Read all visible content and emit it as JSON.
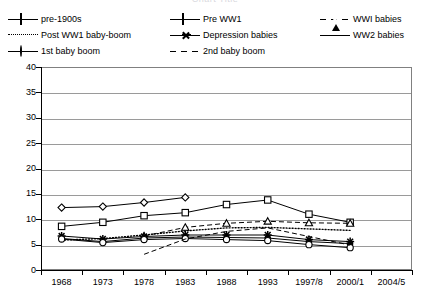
{
  "chart_data": {
    "type": "line",
    "title": "Chart Title",
    "xlabel": "",
    "ylabel": "",
    "ylim": [
      0,
      40
    ],
    "ytick_step": 5,
    "yticks": [
      "0",
      "5",
      "10",
      "15",
      "20",
      "25",
      "30",
      "35",
      "40"
    ],
    "grid": true,
    "legend_position": "top",
    "categories": [
      "1968",
      "1973",
      "1978",
      "1983",
      "1988",
      "1993",
      "1997/8",
      "2000/1",
      "2004/5"
    ],
    "series": [
      {
        "name": "pre-1900s",
        "marker": "open-diamond",
        "line": "solid",
        "values": [
          12.3,
          12.5,
          13.3,
          14.3,
          null,
          null,
          null,
          null,
          null
        ]
      },
      {
        "name": "Pre WW1",
        "marker": "open-square",
        "line": "solid",
        "values": [
          8.6,
          9.4,
          10.7,
          11.3,
          12.9,
          13.8,
          11.0,
          9.4,
          null
        ]
      },
      {
        "name": "WWI babies",
        "marker": "open-triangle",
        "line": "dashed",
        "values": [
          null,
          null,
          6.7,
          8.4,
          9.2,
          9.6,
          9.3,
          9.2,
          null
        ]
      },
      {
        "name": "Post WW1 baby-boom",
        "marker": "none",
        "line": "dotted",
        "values": [
          5.9,
          6.2,
          6.9,
          7.7,
          8.3,
          8.4,
          8.1,
          7.8,
          null
        ]
      },
      {
        "name": "Depression babies",
        "marker": "star",
        "line": "solid",
        "values": [
          6.7,
          6.1,
          6.6,
          6.9,
          6.9,
          6.9,
          6.0,
          5.6,
          null
        ]
      },
      {
        "name": "WW2 babies",
        "marker": "filled-dot",
        "line": "solid",
        "values": [
          6.2,
          5.6,
          6.3,
          6.5,
          6.4,
          6.3,
          5.6,
          5.2,
          null
        ]
      },
      {
        "name": "1st baby boom",
        "marker": "open-circle",
        "line": "solid",
        "values": [
          6.1,
          5.4,
          6.0,
          6.2,
          6.0,
          5.8,
          5.0,
          4.4,
          null
        ]
      },
      {
        "name": "2nd baby boom",
        "marker": "none",
        "line": "dashed",
        "values": [
          null,
          null,
          3.1,
          6.1,
          7.6,
          8.3,
          6.6,
          4.9,
          null
        ]
      }
    ]
  },
  "legend": {
    "items": [
      {
        "label": "pre-1900s",
        "marker": "open-diamond",
        "line": "solid"
      },
      {
        "label": "Pre WW1",
        "marker": "open-square",
        "line": "solid"
      },
      {
        "label": "WWI babies",
        "marker": "open-triangle",
        "line": "dash-gap"
      },
      {
        "label": "Post WW1 baby-boom",
        "marker": "none",
        "line": "dotted"
      },
      {
        "label": "Depression babies",
        "marker": "star",
        "line": "solid"
      },
      {
        "label": "WW2 babies",
        "marker": "filled-dot",
        "line": "solid"
      },
      {
        "label": "1st baby boom",
        "marker": "open-circle",
        "line": "solid"
      },
      {
        "label": "2nd baby boom",
        "marker": "none",
        "line": "dash-gap"
      }
    ]
  },
  "colors": {
    "series": "#000000",
    "grid": "#9a9a9a",
    "frame": "#808080",
    "background": "#ffffff",
    "title": "#d9d9de"
  }
}
